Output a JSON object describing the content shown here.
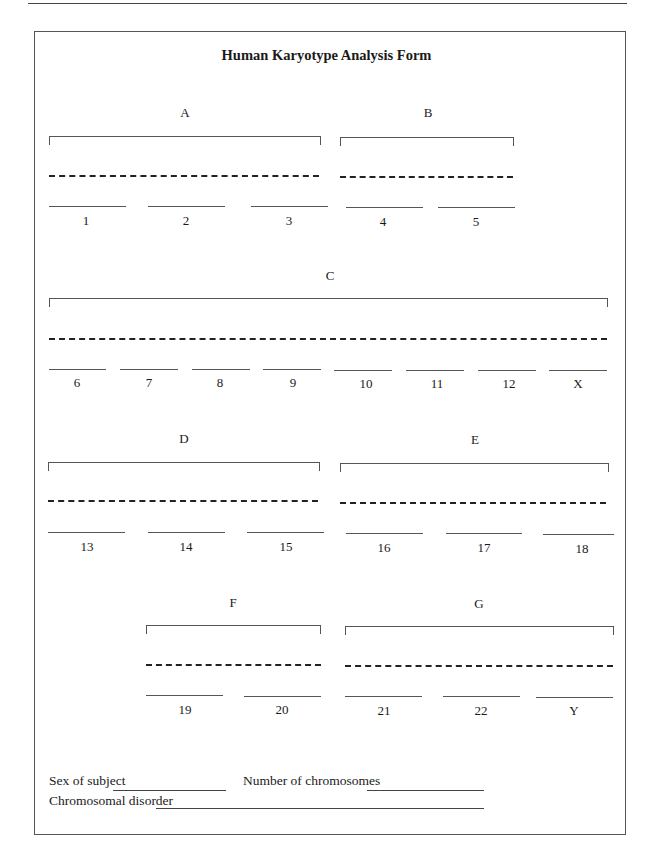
{
  "form": {
    "title": "Human Karyotype Analysis Form",
    "groups": [
      {
        "label": "A",
        "chromosomes": [
          "1",
          "2",
          "3"
        ]
      },
      {
        "label": "B",
        "chromosomes": [
          "4",
          "5"
        ]
      },
      {
        "label": "C",
        "chromosomes": [
          "6",
          "7",
          "8",
          "9",
          "10",
          "11",
          "12",
          "X"
        ]
      },
      {
        "label": "D",
        "chromosomes": [
          "13",
          "14",
          "15"
        ]
      },
      {
        "label": "E",
        "chromosomes": [
          "16",
          "17",
          "18"
        ]
      },
      {
        "label": "F",
        "chromosomes": [
          "19",
          "20"
        ]
      },
      {
        "label": "G",
        "chromosomes": [
          "21",
          "22",
          "Y"
        ]
      }
    ],
    "fields": {
      "sex_label": "Sex of subject",
      "sex_value": "",
      "number_label": "Number of chromosomes",
      "number_value": "",
      "disorder_label": "Chromosomal disorder",
      "disorder_value": ""
    }
  }
}
